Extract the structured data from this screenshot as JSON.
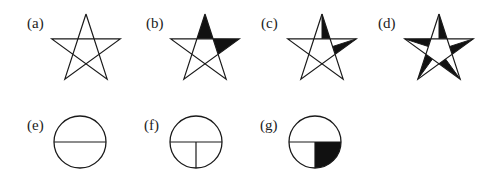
{
  "figure": {
    "stroke_color": "#1a1a1a",
    "fill_color": "#111111",
    "stars": [
      {
        "id": "a",
        "label": "(a)",
        "cx": 86,
        "cy": 50,
        "label_x": 27,
        "label_y": 16,
        "shade": "none"
      },
      {
        "id": "b",
        "label": "(b)",
        "cx": 205,
        "cy": 50,
        "label_x": 146,
        "label_y": 16,
        "shade": "top-and-right-points-full"
      },
      {
        "id": "c",
        "label": "(c)",
        "cx": 322,
        "cy": 50,
        "label_x": 261,
        "label_y": 16,
        "shade": "top-and-right-points-half"
      },
      {
        "id": "d",
        "label": "(d)",
        "cx": 439,
        "cy": 50,
        "label_x": 378,
        "label_y": 16,
        "shade": "all-points-half"
      }
    ],
    "circles": [
      {
        "id": "e",
        "label": "(e)",
        "cx": 80,
        "cy": 142,
        "label_x": 27,
        "label_y": 118,
        "division": "horizontal-diameter"
      },
      {
        "id": "f",
        "label": "(f)",
        "cx": 196,
        "cy": 142,
        "label_x": 144,
        "label_y": 118,
        "division": "horizontal-diameter-plus-lower-vertical-radius"
      },
      {
        "id": "g",
        "label": "(g)",
        "cx": 315,
        "cy": 142,
        "label_x": 260,
        "label_y": 118,
        "division": "horizontal-diameter-plus-lower-vertical-radius, lower-right-quadrant-shaded"
      }
    ]
  }
}
